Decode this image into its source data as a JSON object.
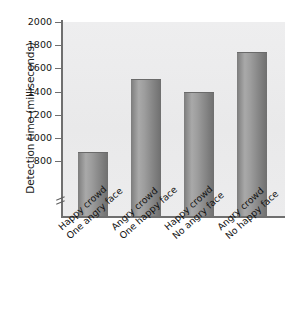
{
  "chart_data": {
    "type": "bar",
    "title": "",
    "xlabel": "",
    "ylabel": "Detection time (milliseconds)",
    "categories": [
      "Happy crowd One angry face",
      "Angry crowd One happy face",
      "Happy crowd No angry face",
      "Angry crowd No happy face"
    ],
    "category_lines": [
      {
        "line1": "Happy crowd",
        "line2": "One angry face"
      },
      {
        "line1": "Angry crowd",
        "line2": "One happy face"
      },
      {
        "line1": "Happy crowd",
        "line2": "No angry face"
      },
      {
        "line1": "Angry crowd",
        "line2": "No happy face"
      }
    ],
    "values": [
      880,
      1510,
      1400,
      1740
    ],
    "ylim": [
      700,
      2000
    ],
    "yticks": [
      800,
      1000,
      1200,
      1400,
      1600,
      1800,
      2000
    ],
    "ytick_labels": [
      "800",
      "1000",
      "1200",
      "1400",
      "1600",
      "1800",
      "2000"
    ],
    "axis_break": true,
    "grid": false,
    "legend": "none",
    "bar_color": "#8c8c8c",
    "plot_background": "#ececed",
    "axis_color": "#6f6f6f"
  }
}
